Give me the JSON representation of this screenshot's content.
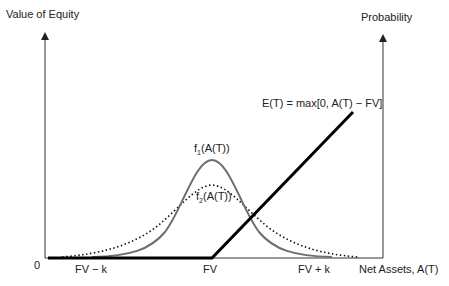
{
  "diagram": {
    "left_axis_label": "Value of Equity",
    "right_axis_label": "Probability",
    "x_axis_label": "Net Assets, A(T)",
    "origin_label": "0",
    "x_ticks": [
      "FV − k",
      "FV",
      "FV + k"
    ],
    "payoff_label": "E(T) = max[0, A(T) − FV]",
    "curves": {
      "f1": {
        "prefix": "f",
        "sub": "1",
        "suffix": "(A(T))",
        "style": "solid",
        "color": "#6e6e6e"
      },
      "f2": {
        "prefix": "f",
        "sub": "2",
        "suffix": "(A(T))",
        "style": "dotted",
        "color": "#111111"
      }
    },
    "payoff_line_color": "#000000",
    "axis_color": "#333333"
  }
}
